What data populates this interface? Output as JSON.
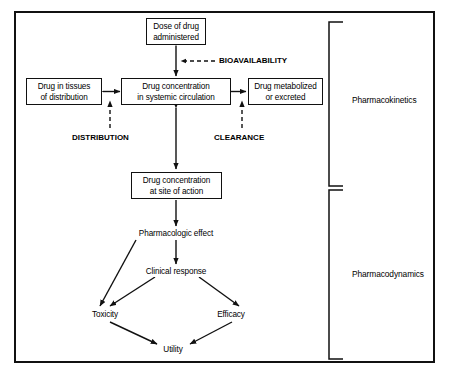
{
  "diagram": {
    "line_color": "#111111",
    "background": "#ffffff",
    "nodes": {
      "dose": "Dose of drug\nadministered",
      "dose_line1": "Dose of drug",
      "dose_line2": "administered",
      "tissues_line1": "Drug in tissues",
      "tissues_line2": "of distribution",
      "systemic_line1": "Drug concentration",
      "systemic_line2": "in systemic circulation",
      "metabolized_line1": "Drug metabolized",
      "metabolized_line2": "or excreted",
      "site_line1": "Drug concentration",
      "site_line2": "at site of action",
      "pharmacologic_effect": "Pharmacologic effect",
      "clinical_response": "Clinical response",
      "toxicity": "Toxicity",
      "efficacy": "Efficacy",
      "utility": "Utility"
    },
    "process_labels": {
      "bioavailability": "BIOAVAILABILITY",
      "distribution": "DISTRIBUTION",
      "clearance": "CLEARANCE"
    },
    "bracket_labels": {
      "pharmacokinetics": "Pharmacokinetics",
      "pharmacodynamics": "Pharmacodynamics"
    }
  }
}
